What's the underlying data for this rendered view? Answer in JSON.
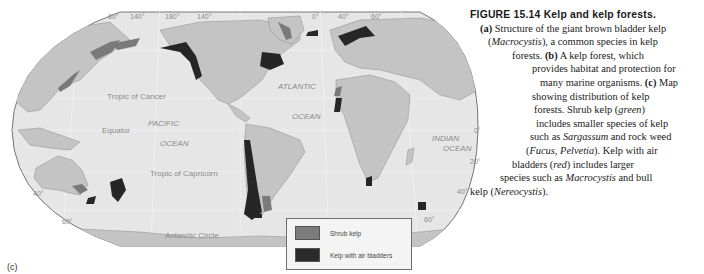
{
  "figure": {
    "title": "FIGURE 15.14 Kelp and kelp forests.",
    "panel_label": "(c)",
    "caption_lines": [
      [
        {
          "t": "(a)",
          "s": "b"
        },
        {
          "t": " Structure of the giant brown bladder kelp"
        }
      ],
      [
        {
          "t": "("
        },
        {
          "t": "Macrocystis",
          "s": "i"
        },
        {
          "t": "), a common species in kelp"
        }
      ],
      [
        {
          "t": "forests. "
        },
        {
          "t": "(b)",
          "s": "b"
        },
        {
          "t": " A kelp forest, which"
        }
      ],
      [
        {
          "t": "provides habitat and protection for"
        }
      ],
      [
        {
          "t": "many marine organisms. "
        },
        {
          "t": "(c)",
          "s": "b"
        },
        {
          "t": " Map"
        }
      ],
      [
        {
          "t": "showing distribution of kelp"
        }
      ],
      [
        {
          "t": "forests. Shrub kelp ("
        },
        {
          "t": "green",
          "s": "i"
        },
        {
          "t": ")"
        }
      ],
      [
        {
          "t": "includes smaller species of kelp"
        }
      ],
      [
        {
          "t": "such as "
        },
        {
          "t": "Sargassum",
          "s": "i"
        },
        {
          "t": " and rock weed"
        }
      ],
      [
        {
          "t": "("
        },
        {
          "t": "Fucus, Pelvetia",
          "s": "i"
        },
        {
          "t": "). Kelp with air"
        }
      ],
      [
        {
          "t": "bladders ("
        },
        {
          "t": "red",
          "s": "i"
        },
        {
          "t": ") includes larger"
        }
      ],
      [
        {
          "t": "species such as "
        },
        {
          "t": "Macrocystis",
          "s": "i"
        },
        {
          "t": " and bull"
        }
      ],
      [
        {
          "t": "kelp ("
        },
        {
          "t": "Nereocystis",
          "s": "i"
        },
        {
          "t": ")."
        }
      ]
    ],
    "caption_indents_px": null
  },
  "map": {
    "labels": {
      "tropic_cancer": "Tropic of Cancer",
      "equator": "Equator",
      "tropic_capricorn": "Tropic of Capricorn",
      "antarctic_circle": "Antarctic Circle",
      "pacific_1": "PACIFIC",
      "pacific_2": "OCEAN",
      "atlantic_1": "ATLANTIC",
      "atlantic_2": "OCEAN",
      "indian_1": "INDIAN",
      "indian_2": "OCEAN"
    },
    "degree_labels": {
      "top": [
        "80°",
        "140°",
        "180°",
        "140°",
        "0°",
        "40°",
        "60°"
      ],
      "left": [
        "40°",
        "60°"
      ],
      "right": [
        "0°",
        "20°",
        "40°",
        "60°"
      ]
    },
    "colors": {
      "ocean": "#e6e6e6",
      "land": "#c4c4c4",
      "shrub_kelp": "#7a7a7a",
      "air_bladder_kelp": "#262626"
    }
  },
  "legend": {
    "items": [
      {
        "label": "Shrub kelp",
        "color": "#7c7c7c"
      },
      {
        "label": "Kelp with air bladders",
        "color": "#2a2a2a"
      }
    ]
  }
}
